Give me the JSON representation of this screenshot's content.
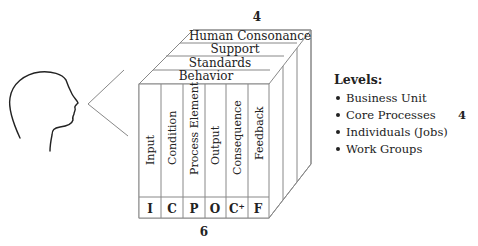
{
  "diagram": {
    "top_count": "4",
    "bottom_count": "6",
    "top_layers": [
      {
        "label": "Human Consonance"
      },
      {
        "label": "Support"
      },
      {
        "label": "Standards"
      },
      {
        "label": "Behavior"
      }
    ],
    "columns": [
      {
        "label": "Input",
        "abbr": "I"
      },
      {
        "label": "Condition",
        "abbr": "C"
      },
      {
        "label": "Process Element",
        "abbr": "P"
      },
      {
        "label": "Output",
        "abbr": "O"
      },
      {
        "label": "Consequence",
        "abbr": "C⁺"
      },
      {
        "label": "Feedback",
        "abbr": "F"
      }
    ],
    "head_icon": "human-head-profile-icon",
    "line_color": "#888888"
  },
  "legend": {
    "title": "Levels:",
    "count": "4",
    "items": [
      {
        "label": "Business Unit"
      },
      {
        "label": "Core Processes"
      },
      {
        "label": "Individuals (Jobs)"
      },
      {
        "label": "Work Groups"
      }
    ]
  }
}
